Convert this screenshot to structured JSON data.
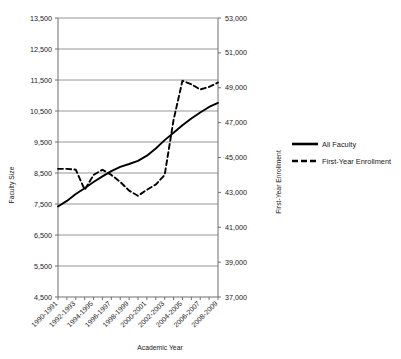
{
  "chart_data": {
    "type": "line",
    "title": "",
    "xlabel": "Academic Year",
    "ylabel": "Faculty Size",
    "y2label": "First-Year Enrollment",
    "grid": true,
    "legend_position": "right",
    "ylim": [
      4500,
      13500
    ],
    "y2lim": [
      37000,
      53000
    ],
    "yticks": [
      "4,500",
      "5,500",
      "6,500",
      "7,500",
      "8,500",
      "9,500",
      "10,500",
      "11,500",
      "12,500",
      "13,500"
    ],
    "y2ticks": [
      "37,000",
      "39,000",
      "41,000",
      "43,000",
      "45,000",
      "47,000",
      "49,000",
      "51,000",
      "53,000"
    ],
    "categories": [
      "1990-1991",
      "1991-1992",
      "1992-1993",
      "1993-1994",
      "1994-1995",
      "1995-1996",
      "1996-1997",
      "1997-1998",
      "1998-1999",
      "1999-2000",
      "2000-2001",
      "2001-2002",
      "2002-2003",
      "2003-2004",
      "2004-2005",
      "2005-2006",
      "2006-2007",
      "2007-2008",
      "2008-2009"
    ],
    "xtick_labels_shown": [
      "1990-1991",
      "1992-1993",
      "1994-1995",
      "1996-1997",
      "1998-1999",
      "2000-2001",
      "2002-2003",
      "2004-2005",
      "2006-2007",
      "2008-2009"
    ],
    "series": [
      {
        "name": "All Faculty",
        "axis": "left",
        "style": "solid",
        "color": "#000000",
        "values": [
          7420,
          7600,
          7820,
          8010,
          8210,
          8390,
          8560,
          8700,
          8790,
          8890,
          9060,
          9290,
          9560,
          9800,
          10040,
          10260,
          10450,
          10630,
          10760
        ]
      },
      {
        "name": "First-Year Enrollment",
        "axis": "right",
        "style": "dashed",
        "color": "#000000",
        "values": [
          44350,
          44350,
          44300,
          43150,
          44000,
          44300,
          44000,
          43600,
          43100,
          42800,
          43150,
          43450,
          44000,
          47150,
          49400,
          49200,
          48900,
          49050,
          49300
        ]
      }
    ]
  },
  "legend": {
    "items": [
      {
        "label": "All Faculty",
        "style": "solid"
      },
      {
        "label": "First-Year Enrollment",
        "style": "dashed"
      }
    ]
  }
}
